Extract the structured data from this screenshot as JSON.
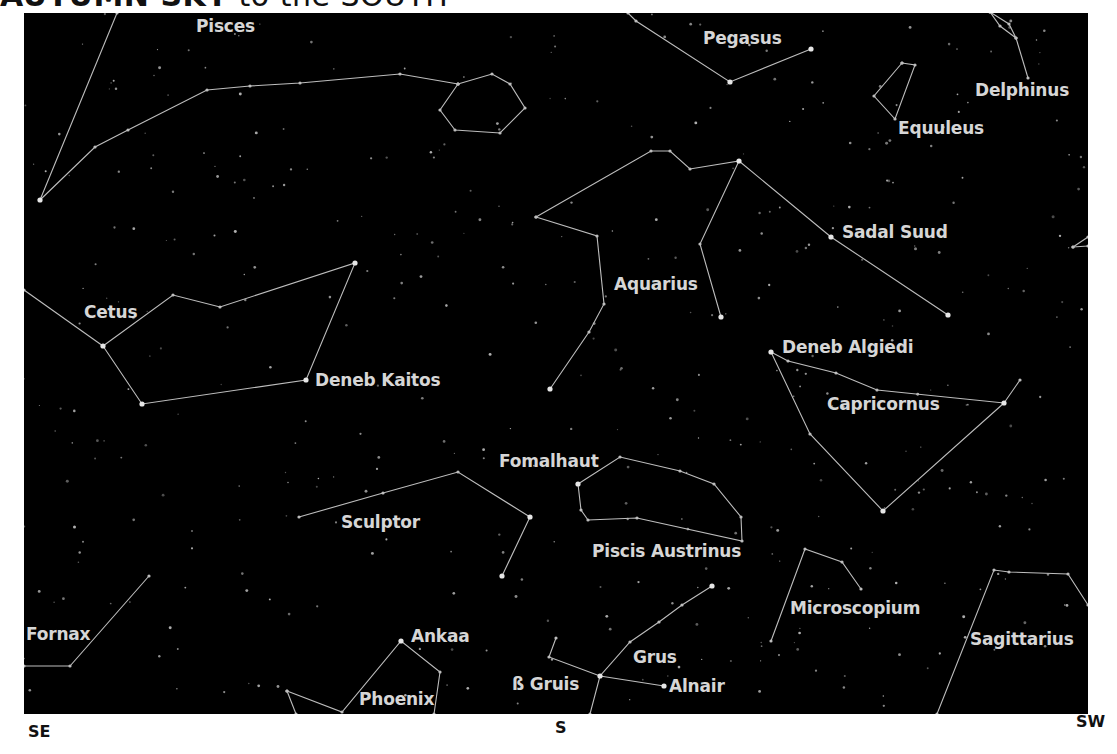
{
  "title": {
    "main": "AUTUMN SKY",
    "rest": " to the SOUTH"
  },
  "directions": [
    {
      "label": "SE",
      "x": 28,
      "y": 722
    },
    {
      "label": "S",
      "x": 555,
      "y": 718
    },
    {
      "label": "SW",
      "x": 1076,
      "y": 712
    }
  ],
  "colors": {
    "sky": "#000000",
    "lines": "#bdbdbd",
    "labels": "#d6d6d6",
    "stars": "#cfcfcf"
  },
  "labels": [
    {
      "text": "Pisces",
      "x": 196,
      "y": 16
    },
    {
      "text": "Pegasus",
      "x": 703,
      "y": 28
    },
    {
      "text": "Delphinus",
      "x": 975,
      "y": 80
    },
    {
      "text": "Equuleus",
      "x": 898,
      "y": 118
    },
    {
      "text": "Sadal Suud",
      "x": 842,
      "y": 222
    },
    {
      "text": "Aquarius",
      "x": 614,
      "y": 274
    },
    {
      "text": "Cetus",
      "x": 84,
      "y": 302
    },
    {
      "text": "Deneb Kaitos",
      "x": 315,
      "y": 370
    },
    {
      "text": "Deneb Algiedi",
      "x": 782,
      "y": 337
    },
    {
      "text": "Capricornus",
      "x": 827,
      "y": 394
    },
    {
      "text": "Fomalhaut",
      "x": 499,
      "y": 451
    },
    {
      "text": "Sculptor",
      "x": 341,
      "y": 512
    },
    {
      "text": "Piscis Austrinus",
      "x": 592,
      "y": 541
    },
    {
      "text": "Microscopium",
      "x": 790,
      "y": 598
    },
    {
      "text": "Sagittarius",
      "x": 970,
      "y": 629
    },
    {
      "text": "Fornax",
      "x": 26,
      "y": 624
    },
    {
      "text": "Ankaa",
      "x": 411,
      "y": 626
    },
    {
      "text": "Phoenix",
      "x": 359,
      "y": 689
    },
    {
      "text": "Grus",
      "x": 633,
      "y": 647
    },
    {
      "text": "ß Gruis",
      "x": 512,
      "y": 674
    },
    {
      "text": "Alnair",
      "x": 669,
      "y": 676
    }
  ],
  "constellations": [
    {
      "name": "Pisces",
      "lines": [
        [
          [
            117,
            13
          ],
          [
            40,
            200
          ]
        ],
        [
          [
            40,
            200
          ],
          [
            95,
            147
          ],
          [
            128,
            130
          ],
          [
            207,
            90
          ],
          [
            250,
            86
          ],
          [
            300,
            83
          ],
          [
            400,
            74
          ],
          [
            458,
            84
          ]
        ],
        [
          [
            458,
            84
          ],
          [
            492,
            74
          ],
          [
            510,
            84
          ],
          [
            525,
            108
          ],
          [
            500,
            133
          ],
          [
            455,
            130
          ],
          [
            440,
            110
          ],
          [
            458,
            84
          ]
        ]
      ]
    },
    {
      "name": "Pegasus",
      "lines": [
        [
          [
            628,
            13
          ],
          [
            636,
            21
          ],
          [
            730,
            82
          ],
          [
            811,
            49
          ]
        ]
      ]
    },
    {
      "name": "Delphinus",
      "lines": [
        [
          [
            990,
            12
          ],
          [
            1009,
            24
          ],
          [
            1016,
            38
          ],
          [
            1000,
            26
          ],
          [
            990,
            12
          ]
        ],
        [
          [
            1016,
            38
          ],
          [
            1028,
            78
          ]
        ]
      ]
    },
    {
      "name": "Equuleus",
      "lines": [
        [
          [
            902,
            63
          ],
          [
            915,
            65
          ],
          [
            895,
            119
          ],
          [
            874,
            96
          ],
          [
            902,
            63
          ]
        ]
      ]
    },
    {
      "name": "Aquarius",
      "lines": [
        [
          [
            536,
            217
          ],
          [
            597,
            236
          ],
          [
            604,
            304
          ],
          [
            589,
            332
          ],
          [
            550,
            389
          ]
        ],
        [
          [
            536,
            217
          ],
          [
            651,
            151
          ],
          [
            670,
            151
          ],
          [
            690,
            169
          ],
          [
            739,
            161
          ],
          [
            700,
            244
          ],
          [
            721,
            317
          ]
        ],
        [
          [
            739,
            161
          ],
          [
            831,
            237
          ],
          [
            948,
            315
          ]
        ]
      ]
    },
    {
      "name": "Capricornus",
      "lines": [
        [
          [
            771,
            352
          ],
          [
            788,
            361
          ],
          [
            836,
            373
          ],
          [
            877,
            390
          ],
          [
            1004,
            403
          ],
          [
            1020,
            380
          ]
        ],
        [
          [
            771,
            352
          ],
          [
            810,
            434
          ],
          [
            883,
            511
          ],
          [
            1004,
            403
          ]
        ]
      ]
    },
    {
      "name": "Cetus",
      "lines": [
        [
          [
            24,
            290
          ],
          [
            103,
            346
          ]
        ],
        [
          [
            103,
            346
          ],
          [
            173,
            295
          ],
          [
            220,
            307
          ],
          [
            355,
            263
          ],
          [
            306,
            380
          ],
          [
            142,
            404
          ],
          [
            103,
            346
          ]
        ]
      ]
    },
    {
      "name": "Sculptor",
      "lines": [
        [
          [
            299,
            517
          ],
          [
            383,
            493
          ],
          [
            458,
            472
          ],
          [
            530,
            517
          ],
          [
            502,
            576
          ]
        ]
      ]
    },
    {
      "name": "Piscis Austrinus",
      "lines": [
        [
          [
            578,
            484
          ],
          [
            620,
            457
          ],
          [
            680,
            471
          ],
          [
            714,
            484
          ],
          [
            741,
            517
          ],
          [
            742,
            541
          ],
          [
            637,
            518
          ],
          [
            588,
            520
          ],
          [
            581,
            510
          ],
          [
            578,
            484
          ]
        ]
      ]
    },
    {
      "name": "Fornax",
      "lines": [
        [
          [
            24,
            666
          ],
          [
            70,
            666
          ],
          [
            149,
            576
          ]
        ]
      ]
    },
    {
      "name": "Phoenix",
      "lines": [
        [
          [
            287,
            691
          ],
          [
            342,
            712
          ],
          [
            401,
            641
          ],
          [
            440,
            672
          ],
          [
            434,
            714
          ]
        ],
        [
          [
            287,
            691
          ],
          [
            296,
            714
          ]
        ]
      ]
    },
    {
      "name": "Grus",
      "lines": [
        [
          [
            712,
            586
          ],
          [
            682,
            605
          ],
          [
            659,
            622
          ],
          [
            630,
            642
          ],
          [
            600,
            676
          ],
          [
            590,
            714
          ]
        ],
        [
          [
            556,
            638
          ],
          [
            549,
            657
          ],
          [
            600,
            676
          ],
          [
            664,
            686
          ]
        ]
      ]
    },
    {
      "name": "Microscopium",
      "lines": [
        [
          [
            771,
            641
          ],
          [
            805,
            549
          ],
          [
            842,
            562
          ],
          [
            861,
            589
          ]
        ]
      ]
    },
    {
      "name": "Sagittarius",
      "lines": [
        [
          [
            937,
            714
          ],
          [
            994,
            570
          ],
          [
            1009,
            572
          ],
          [
            1068,
            574
          ],
          [
            1088,
            605
          ]
        ]
      ]
    },
    {
      "name": "Piscis-edge",
      "lines": [
        [
          [
            1073,
            247
          ],
          [
            1088,
            237
          ]
        ],
        [
          [
            1073,
            247
          ],
          [
            1088,
            246
          ]
        ]
      ]
    }
  ],
  "bright_stars": [
    [
      40,
      200
    ],
    [
      811,
      49
    ],
    [
      730,
      82
    ],
    [
      739,
      161
    ],
    [
      831,
      237
    ],
    [
      948,
      315
    ],
    [
      771,
      352
    ],
    [
      1004,
      403
    ],
    [
      103,
      346
    ],
    [
      306,
      380
    ],
    [
      355,
      263
    ],
    [
      142,
      404
    ],
    [
      578,
      484
    ],
    [
      401,
      641
    ],
    [
      600,
      676
    ],
    [
      664,
      686
    ],
    [
      712,
      586
    ],
    [
      883,
      511
    ],
    [
      530,
      517
    ],
    [
      502,
      576
    ],
    [
      550,
      389
    ],
    [
      721,
      317
    ]
  ]
}
